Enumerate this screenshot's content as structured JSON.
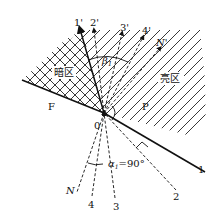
{
  "diagram": {
    "regions": {
      "dark": "暗区",
      "bright": "亮区"
    },
    "points": {
      "origin": "0",
      "F": "F",
      "P": "P"
    },
    "rays_upper": [
      "1'",
      "2'",
      "3'",
      "4'",
      "N'"
    ],
    "rays_lower": [
      "1",
      "2",
      "3",
      "4",
      "N"
    ],
    "angles": {
      "beta": "β",
      "beta_sub": "1",
      "alpha": "α",
      "alpha_sub": "1",
      "alpha_value": "=90°"
    },
    "colors": {
      "line": "#111111",
      "hatch": "#222222",
      "background": "#ffffff"
    }
  }
}
